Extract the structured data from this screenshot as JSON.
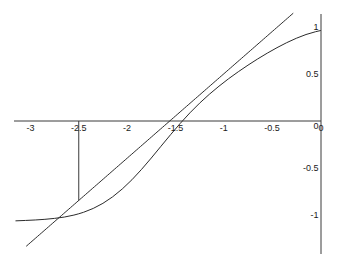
{
  "chart_data": {
    "type": "line",
    "title": "",
    "subtitle": "",
    "xlabel": "",
    "ylabel": "",
    "xlim": [
      -3.15,
      0.02
    ],
    "ylim": [
      -1.32,
      1.12
    ],
    "grid": false,
    "legend": "none",
    "background_color": "#ffffff",
    "line_color": "#2b2b2b",
    "axis_color": "#3a3a3a",
    "xticks": [
      -3,
      -2.5,
      -2,
      -1.5,
      -1,
      -0.5,
      0
    ],
    "xtick_labels": [
      "-3",
      "-2.5",
      "-2",
      "-1.5",
      "-1",
      "-0.5",
      "0"
    ],
    "yticks": [
      1,
      0.5,
      0,
      -0.5,
      -1
    ],
    "ytick_labels": [
      "1",
      "0.5",
      "0",
      "-0.5",
      "-1"
    ],
    "axes": {
      "x_axis_at_y": 0,
      "y_axis_at_x": 0,
      "x_axis_range": [
        -3.15,
        0.0
      ],
      "y_axis_range": [
        -1.32,
        1.12
      ]
    },
    "annotations": [
      {
        "name": "tangency-dropline",
        "type": "vertical-segment",
        "x": -2.5,
        "y_from": 0,
        "y_to": -0.845
      }
    ],
    "series": [
      {
        "name": "sigmoid-curve",
        "type": "line",
        "color": "#2b2b2b",
        "x": [
          -3.15,
          -3.05,
          -2.95,
          -2.85,
          -2.75,
          -2.65,
          -2.55,
          -2.5,
          -2.45,
          -2.35,
          -2.25,
          -2.15,
          -2.05,
          -1.95,
          -1.85,
          -1.75,
          -1.65,
          -1.55,
          -1.45,
          -1.35,
          -1.25,
          -1.15,
          -1.05,
          -0.95,
          -0.85,
          -0.75,
          -0.65,
          -0.55,
          -0.45,
          -0.35,
          -0.25,
          -0.15,
          -0.05,
          0.0
        ],
        "y": [
          -1.062,
          -1.058,
          -1.053,
          -1.046,
          -1.036,
          -1.022,
          -1.001,
          -0.987,
          -0.971,
          -0.93,
          -0.876,
          -0.807,
          -0.723,
          -0.625,
          -0.514,
          -0.394,
          -0.269,
          -0.145,
          -0.025,
          0.087,
          0.19,
          0.284,
          0.37,
          0.45,
          0.524,
          0.594,
          0.66,
          0.722,
          0.78,
          0.833,
          0.88,
          0.92,
          0.95,
          0.962
        ]
      },
      {
        "name": "tangent-line",
        "type": "line",
        "color": "#2b2b2b",
        "x": [
          -3.04,
          -2.5,
          0.0
        ],
        "y": [
          -1.33,
          -0.845,
          1.4
        ],
        "slope": 0.894,
        "x_intercept": -1.555,
        "y_at_x0": 0.625,
        "tangency_point": [
          -2.5,
          -0.845
        ]
      }
    ]
  }
}
